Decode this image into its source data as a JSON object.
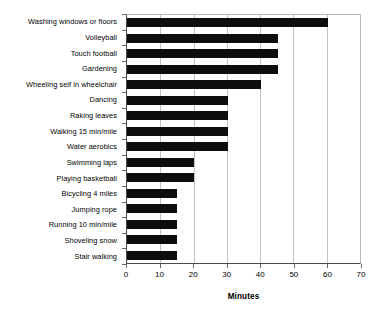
{
  "chart_data": {
    "type": "bar",
    "orientation": "horizontal",
    "title": "",
    "xlabel": "Minutes",
    "ylabel": "",
    "xlim": [
      0,
      70
    ],
    "xticks": [
      0,
      10,
      20,
      30,
      40,
      50,
      60,
      70
    ],
    "grid": "vertical",
    "legend": "none",
    "bar_color": "#0d0d0d",
    "categories": [
      "Washing windows or floors",
      "Volleyball",
      "Touch football",
      "Gardening",
      "Wheeling self in wheelchair",
      "Dancing",
      "Raking leaves",
      "Walking 15 min/mile",
      "Water aerobics",
      "Swimming laps",
      "Playing basketball",
      "Bicycling 4 miles",
      "Jumping rope",
      "Running 10 min/mile",
      "Shoveling snow",
      "Stair walking"
    ],
    "values": [
      60,
      45,
      45,
      45,
      40,
      30,
      30,
      30,
      30,
      20,
      20,
      15,
      15,
      15,
      15,
      15
    ]
  }
}
